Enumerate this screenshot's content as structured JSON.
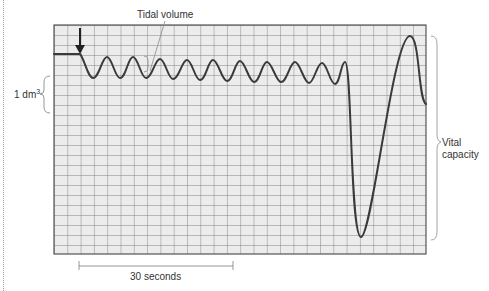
{
  "figure": {
    "labels": {
      "tidal_volume": "Tidal volume",
      "volume_scale_value": "1 dm",
      "volume_scale_exponent": "3",
      "vital_capacity_line1": "Vital",
      "vital_capacity_line2": "capacity",
      "time_scale": "30 seconds"
    },
    "grid": {
      "x": 54,
      "y": 25,
      "width": 372,
      "height": 229,
      "cell_width": 13.3,
      "cell_height": 10,
      "background": "#ececec",
      "line_color": "#7a7a7a",
      "border_color": "#555555"
    },
    "trace": {
      "stroke": "#3a3a3a",
      "start_marker": "down-arrow",
      "points_description": "flat baseline, ten tidal breaths, then maximal exhalation/inhalation for vital capacity"
    },
    "colors": {
      "annotation": "#8a8a8a",
      "text": "#333333"
    }
  }
}
